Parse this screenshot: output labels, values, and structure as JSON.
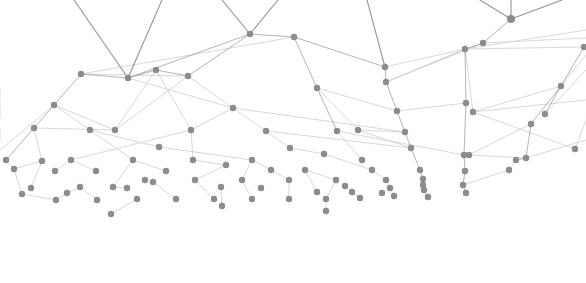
{
  "graphic": {
    "type": "network-plexus",
    "width": 586,
    "height": 283,
    "background": "#ffffff",
    "node_color": "#8c8c8c",
    "edge_color_strong": "#8f8f8f",
    "edge_color_light": "#d4d4d4",
    "node_radius": 3.2
  },
  "nodes": [
    {
      "id": 0,
      "x": 81,
      "y": 74
    },
    {
      "id": 1,
      "x": 128,
      "y": 78
    },
    {
      "id": 2,
      "x": 156,
      "y": 70
    },
    {
      "id": 3,
      "x": 188,
      "y": 76
    },
    {
      "id": 4,
      "x": 250,
      "y": 34
    },
    {
      "id": 5,
      "x": 294,
      "y": 37
    },
    {
      "id": 6,
      "x": 385,
      "y": 67
    },
    {
      "id": 7,
      "x": 386,
      "y": 82
    },
    {
      "id": 8,
      "x": 511,
      "y": 19
    },
    {
      "id": 9,
      "x": 483,
      "y": 43
    },
    {
      "id": 10,
      "x": 465,
      "y": 49
    },
    {
      "id": 11,
      "x": 584,
      "y": 47
    },
    {
      "id": 12,
      "x": 54,
      "y": 105
    },
    {
      "id": 13,
      "x": 233,
      "y": 108
    },
    {
      "id": 14,
      "x": 317,
      "y": 88
    },
    {
      "id": 15,
      "x": 561,
      "y": 86
    },
    {
      "id": 16,
      "x": 34,
      "y": 128
    },
    {
      "id": 17,
      "x": 90,
      "y": 130
    },
    {
      "id": 18,
      "x": 115,
      "y": 130
    },
    {
      "id": 19,
      "x": 191,
      "y": 130
    },
    {
      "id": 20,
      "x": 266,
      "y": 131
    },
    {
      "id": 21,
      "x": 337,
      "y": 131
    },
    {
      "id": 22,
      "x": 358,
      "y": 130
    },
    {
      "id": 23,
      "x": 397,
      "y": 111
    },
    {
      "id": 24,
      "x": 405,
      "y": 132
    },
    {
      "id": 25,
      "x": 466,
      "y": 103
    },
    {
      "id": 26,
      "x": 473,
      "y": 112
    },
    {
      "id": 27,
      "x": 531,
      "y": 124
    },
    {
      "id": 28,
      "x": 545,
      "y": 114
    },
    {
      "id": 29,
      "x": 159,
      "y": 147
    },
    {
      "id": 30,
      "x": 290,
      "y": 148
    },
    {
      "id": 31,
      "x": 411,
      "y": 148
    },
    {
      "id": 32,
      "x": 464,
      "y": 155
    },
    {
      "id": 33,
      "x": 469,
      "y": 155
    },
    {
      "id": 34,
      "x": 575,
      "y": 149
    },
    {
      "id": 35,
      "x": 6,
      "y": 160
    },
    {
      "id": 36,
      "x": 42,
      "y": 161
    },
    {
      "id": 37,
      "x": 71,
      "y": 160
    },
    {
      "id": 38,
      "x": 133,
      "y": 160
    },
    {
      "id": 39,
      "x": 193,
      "y": 160
    },
    {
      "id": 40,
      "x": 252,
      "y": 160
    },
    {
      "id": 41,
      "x": 324,
      "y": 154
    },
    {
      "id": 42,
      "x": 362,
      "y": 160
    },
    {
      "id": 43,
      "x": 420,
      "y": 170
    },
    {
      "id": 44,
      "x": 516,
      "y": 160
    },
    {
      "id": 45,
      "x": 526,
      "y": 158
    },
    {
      "id": 46,
      "x": 14,
      "y": 169
    },
    {
      "id": 47,
      "x": 55,
      "y": 171
    },
    {
      "id": 48,
      "x": 96,
      "y": 171
    },
    {
      "id": 49,
      "x": 166,
      "y": 171
    },
    {
      "id": 50,
      "x": 226,
      "y": 165
    },
    {
      "id": 51,
      "x": 271,
      "y": 170
    },
    {
      "id": 52,
      "x": 305,
      "y": 170
    },
    {
      "id": 53,
      "x": 372,
      "y": 170
    },
    {
      "id": 54,
      "x": 465,
      "y": 171
    },
    {
      "id": 55,
      "x": 509,
      "y": 170
    },
    {
      "id": 56,
      "x": 31,
      "y": 188
    },
    {
      "id": 57,
      "x": 80,
      "y": 187
    },
    {
      "id": 58,
      "x": 113,
      "y": 187
    },
    {
      "id": 59,
      "x": 145,
      "y": 180
    },
    {
      "id": 60,
      "x": 153,
      "y": 182
    },
    {
      "id": 61,
      "x": 195,
      "y": 180
    },
    {
      "id": 62,
      "x": 242,
      "y": 180
    },
    {
      "id": 63,
      "x": 289,
      "y": 180
    },
    {
      "id": 64,
      "x": 336,
      "y": 180
    },
    {
      "id": 65,
      "x": 386,
      "y": 180
    },
    {
      "id": 66,
      "x": 423,
      "y": 179
    },
    {
      "id": 67,
      "x": 423,
      "y": 185
    },
    {
      "id": 68,
      "x": 424,
      "y": 190
    },
    {
      "id": 69,
      "x": 463,
      "y": 185
    },
    {
      "id": 70,
      "x": 22,
      "y": 194
    },
    {
      "id": 71,
      "x": 67,
      "y": 193
    },
    {
      "id": 72,
      "x": 127,
      "y": 188
    },
    {
      "id": 73,
      "x": 221,
      "y": 187
    },
    {
      "id": 74,
      "x": 261,
      "y": 188
    },
    {
      "id": 75,
      "x": 317,
      "y": 192
    },
    {
      "id": 76,
      "x": 345,
      "y": 186
    },
    {
      "id": 77,
      "x": 352,
      "y": 192
    },
    {
      "id": 78,
      "x": 382,
      "y": 193
    },
    {
      "id": 79,
      "x": 390,
      "y": 188
    },
    {
      "id": 80,
      "x": 394,
      "y": 196
    },
    {
      "id": 81,
      "x": 428,
      "y": 197
    },
    {
      "id": 82,
      "x": 466,
      "y": 193
    },
    {
      "id": 83,
      "x": 56,
      "y": 200
    },
    {
      "id": 84,
      "x": 97,
      "y": 200
    },
    {
      "id": 85,
      "x": 137,
      "y": 199
    },
    {
      "id": 86,
      "x": 176,
      "y": 199
    },
    {
      "id": 87,
      "x": 214,
      "y": 199
    },
    {
      "id": 88,
      "x": 252,
      "y": 199
    },
    {
      "id": 89,
      "x": 289,
      "y": 199
    },
    {
      "id": 90,
      "x": 326,
      "y": 199
    },
    {
      "id": 91,
      "x": 360,
      "y": 198
    },
    {
      "id": 92,
      "x": 111,
      "y": 214
    },
    {
      "id": 93,
      "x": 222,
      "y": 206
    },
    {
      "id": 94,
      "x": 326,
      "y": 211
    }
  ],
  "edges_strong": [
    [
      1,
      74,
      0
    ],
    [
      1,
      162,
      0
    ],
    [
      4,
      222,
      0
    ],
    [
      4,
      278,
      0
    ],
    [
      8,
      480,
      0
    ],
    [
      8,
      511,
      0
    ],
    [
      8,
      562,
      0
    ],
    [
      6,
      367,
      0
    ],
    [
      0,
      1
    ],
    [
      1,
      2
    ],
    [
      2,
      3
    ],
    [
      3,
      4
    ],
    [
      4,
      5
    ],
    [
      4,
      1
    ],
    [
      5,
      6
    ],
    [
      6,
      7
    ],
    [
      9,
      8
    ],
    [
      10,
      9
    ],
    [
      10,
      25
    ],
    [
      25,
      32
    ],
    [
      32,
      54
    ],
    [
      54,
      69
    ],
    [
      69,
      82
    ],
    [
      7,
      23
    ],
    [
      23,
      24
    ],
    [
      24,
      31
    ],
    [
      31,
      43
    ],
    [
      43,
      66
    ],
    [
      66,
      67
    ],
    [
      67,
      68
    ],
    [
      68,
      81
    ],
    [
      5,
      14
    ],
    [
      14,
      21
    ],
    [
      12,
      0
    ],
    [
      12,
      16
    ],
    [
      16,
      35
    ],
    [
      11,
      15
    ],
    [
      15,
      27
    ],
    [
      27,
      45
    ],
    [
      45,
      44
    ],
    [
      28,
      15
    ]
  ],
  "edges_light": [
    [
      0,
      3
    ],
    [
      2,
      18
    ],
    [
      2,
      19
    ],
    [
      3,
      13
    ],
    [
      13,
      20
    ],
    [
      13,
      19
    ],
    [
      19,
      39
    ],
    [
      18,
      12
    ],
    [
      17,
      29
    ],
    [
      29,
      40
    ],
    [
      20,
      30
    ],
    [
      30,
      41
    ],
    [
      41,
      53
    ],
    [
      53,
      65
    ],
    [
      65,
      80
    ],
    [
      21,
      42
    ],
    [
      22,
      24
    ],
    [
      22,
      31
    ],
    [
      10,
      7
    ],
    [
      9,
      7
    ],
    [
      10,
      26
    ],
    [
      26,
      15
    ],
    [
      26,
      34
    ],
    [
      11,
      10
    ],
    [
      14,
      22
    ],
    [
      12,
      17
    ],
    [
      16,
      36
    ],
    [
      36,
      46
    ],
    [
      36,
      56
    ],
    [
      37,
      47
    ],
    [
      37,
      48
    ],
    [
      38,
      49
    ],
    [
      38,
      58
    ],
    [
      39,
      50
    ],
    [
      40,
      51
    ],
    [
      40,
      62
    ],
    [
      50,
      61
    ],
    [
      51,
      63
    ],
    [
      52,
      64
    ],
    [
      52,
      75
    ],
    [
      57,
      71
    ],
    [
      57,
      84
    ],
    [
      58,
      72
    ],
    [
      60,
      86
    ],
    [
      61,
      87
    ],
    [
      62,
      88
    ],
    [
      63,
      89
    ],
    [
      64,
      90
    ],
    [
      76,
      91
    ],
    [
      77,
      91
    ],
    [
      83,
      71
    ],
    [
      92,
      85
    ],
    [
      93,
      73
    ],
    [
      94,
      90
    ],
    [
      20,
      31
    ],
    [
      23,
      25
    ],
    [
      27,
      33
    ],
    [
      44,
      55
    ],
    [
      55,
      69
    ],
    [
      0,
      5
    ],
    [
      1,
      13
    ],
    [
      14,
      23
    ],
    [
      6,
      10
    ],
    [
      7,
      9
    ],
    [
      13,
      24
    ],
    [
      21,
      32
    ],
    [
      33,
      45
    ],
    [
      3,
      18
    ],
    [
      19,
      37
    ],
    [
      16,
      18
    ],
    [
      17,
      38
    ],
    [
      35,
      46
    ],
    [
      46,
      70
    ],
    [
      70,
      83
    ]
  ],
  "edges_offscreen": [
    [
      0,
      100,
      "0,88"
    ],
    [
      0,
      118,
      "0,102"
    ],
    [
      0,
      140,
      "0,128"
    ],
    [
      586,
      30,
      "465,49"
    ],
    [
      586,
      38,
      "483,43"
    ],
    [
      586,
      55,
      "561,86"
    ],
    [
      586,
      70,
      "545,114"
    ],
    [
      586,
      100,
      "473,112"
    ],
    [
      586,
      140,
      "526,158"
    ],
    [
      0,
      150,
      "54,105"
    ],
    [
      586,
      120,
      "575,149"
    ]
  ]
}
